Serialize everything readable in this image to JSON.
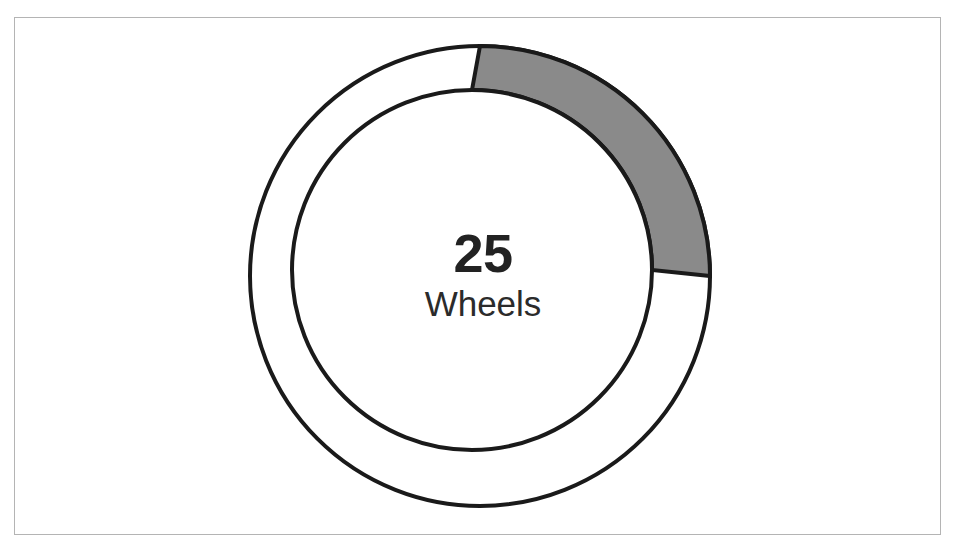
{
  "figure": {
    "background_color": "#ffffff",
    "frame_color": "#b4b4b4",
    "width": 955,
    "height": 545
  },
  "center_label": {
    "value": "25",
    "name": "Wheels"
  },
  "colors": {
    "filled_segment": "#8a8a8a",
    "empty_segment": "#ffffff",
    "outline": "#1a1a1a",
    "value_text": "#222222",
    "name_text": "#2b2b2b"
  },
  "chart_data": {
    "type": "pie",
    "title": "",
    "subtitle": "",
    "xlabel": "",
    "ylabel": "",
    "variant": "donut-gauge",
    "center_text_value": "25",
    "center_text_label": "Wheels",
    "total": 100,
    "units": "percent",
    "start_angle_deg": 90,
    "direction": "clockwise",
    "hole_fraction": 0.78,
    "labels": [
      "Wheels",
      "Remaining"
    ],
    "values": [
      25,
      75
    ],
    "colors": [
      "#8a8a8a",
      "#ffffff"
    ],
    "slices": [
      {
        "name": "Wheels",
        "value": 25,
        "percent": 25,
        "color": "#8a8a8a",
        "start_angle_deg": 0,
        "end_angle_deg": 90
      },
      {
        "name": "Remaining",
        "value": 75,
        "percent": 75,
        "color": "#ffffff",
        "start_angle_deg": 90,
        "end_angle_deg": 360
      }
    ],
    "legend": [],
    "legend_position": "none",
    "grid": false,
    "annotations": [
      "25",
      "Wheels"
    ]
  }
}
